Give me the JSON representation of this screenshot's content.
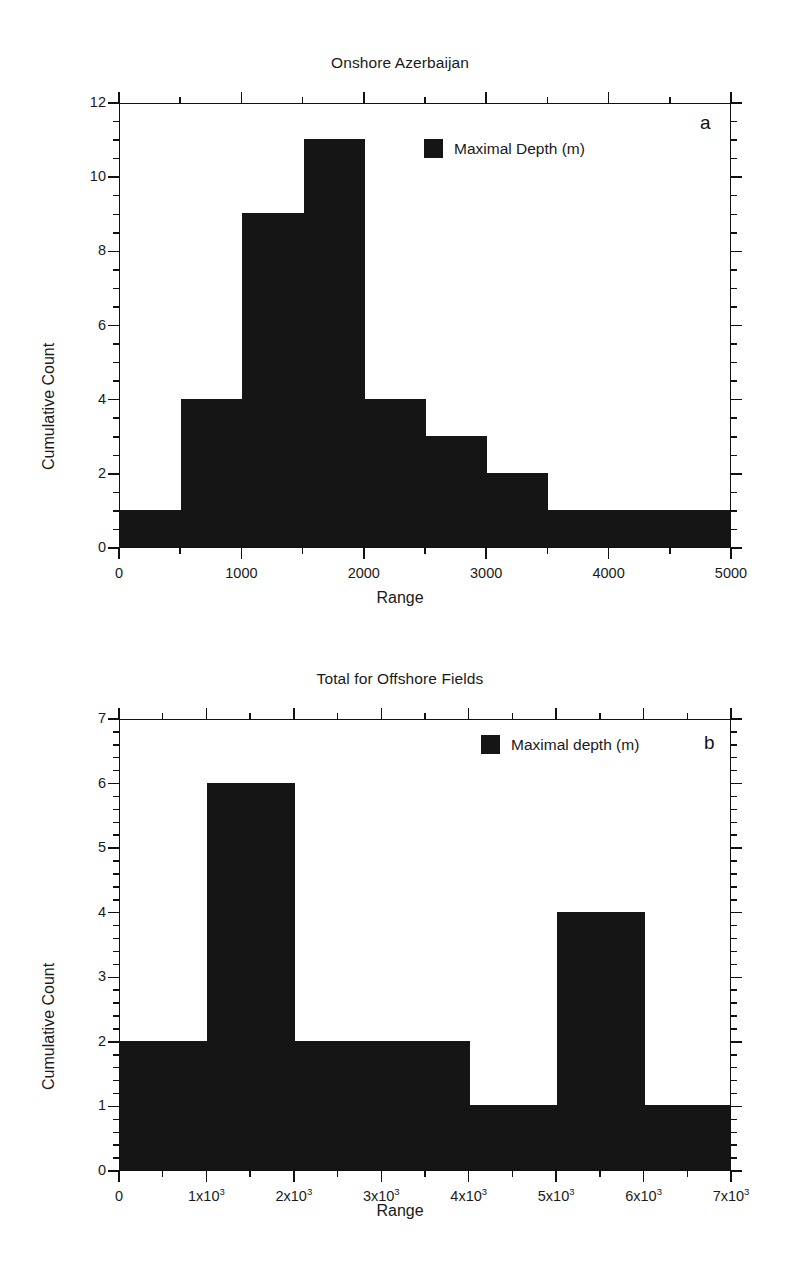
{
  "figure": {
    "background": "#ffffff",
    "ink_color": "#151515"
  },
  "chart_data": [
    {
      "id": "a",
      "type": "bar",
      "title": "Onshore Azerbaijan",
      "panel_letter": "a",
      "xlabel": "Range",
      "ylabel": "Cumulative Count",
      "legend": {
        "label": "Maximal Depth (m)",
        "position": "top-right-inside",
        "swatch_color": "#151515"
      },
      "xlim": [
        0,
        5000
      ],
      "ylim": [
        0,
        12
      ],
      "grid": false,
      "bin_width": 500,
      "x_major_ticks": [
        0,
        1000,
        2000,
        3000,
        4000,
        5000
      ],
      "x_major_tick_labels": [
        "0",
        "1000",
        "2000",
        "3000",
        "4000",
        "5000"
      ],
      "x_minor_tick_step": 500,
      "y_major_ticks": [
        0,
        2,
        4,
        6,
        8,
        10,
        12
      ],
      "y_major_tick_labels": [
        "0",
        "2",
        "4",
        "6",
        "8",
        "10",
        "12"
      ],
      "y_minor_tick_step": 0.5,
      "bin_edges": [
        0,
        500,
        1000,
        1500,
        2000,
        2500,
        3000,
        3500,
        4000,
        4500,
        5000
      ],
      "categories": [
        "0-500",
        "500-1000",
        "1000-1500",
        "1500-2000",
        "2000-2500",
        "2500-3000",
        "3000-3500",
        "3500-4000",
        "4000-4500",
        "4500-5000"
      ],
      "values": [
        1,
        4,
        9,
        11,
        4,
        3,
        2,
        1,
        1,
        1
      ]
    },
    {
      "id": "b",
      "type": "bar",
      "title": "Total for Offshore Fields",
      "panel_letter": "b",
      "xlabel": "Range",
      "ylabel": "Cumulative Count",
      "legend": {
        "label": "Maximal depth (m)",
        "position": "top-right-inside",
        "swatch_color": "#151515"
      },
      "xlim": [
        0,
        7000
      ],
      "ylim": [
        0,
        7
      ],
      "grid": false,
      "bin_width": 1000,
      "x_major_ticks": [
        0,
        1000,
        2000,
        3000,
        4000,
        5000,
        6000,
        7000
      ],
      "x_major_tick_labels": [
        "0",
        "1x10^3",
        "2x10^3",
        "3x10^3",
        "4x10^3",
        "5x10^3",
        "6x10^3",
        "7x10^3"
      ],
      "x_minor_tick_step": 500,
      "y_major_ticks": [
        0,
        1,
        2,
        3,
        4,
        5,
        6,
        7
      ],
      "y_major_tick_labels": [
        "0",
        "1",
        "2",
        "3",
        "4",
        "5",
        "6",
        "7"
      ],
      "y_minor_tick_step": 0.2,
      "bin_edges": [
        0,
        1000,
        2000,
        3000,
        4000,
        5000,
        6000,
        7000
      ],
      "categories": [
        "0-1000",
        "1000-2000",
        "2000-3000",
        "3000-4000",
        "4000-5000",
        "5000-6000",
        "6000-7000"
      ],
      "values": [
        2,
        6,
        2,
        2,
        1,
        4,
        1
      ]
    }
  ]
}
